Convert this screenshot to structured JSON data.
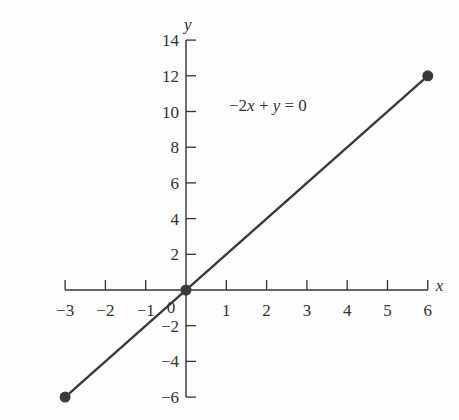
{
  "chart_data": {
    "type": "line",
    "title": "",
    "xlabel": "x",
    "ylabel": "y",
    "annotation": "−2x + y = 0",
    "xlim": [
      -3,
      6
    ],
    "ylim": [
      -6,
      14
    ],
    "grid": false,
    "x_ticks": [
      -3,
      -2,
      -1,
      0,
      1,
      2,
      3,
      4,
      5,
      6
    ],
    "x_tick_labels": [
      "−3",
      "−2",
      "−1",
      "0",
      "1",
      "2",
      "3",
      "4",
      "5",
      "6"
    ],
    "y_ticks": [
      -6,
      -4,
      -2,
      2,
      4,
      6,
      8,
      10,
      12,
      14
    ],
    "y_tick_labels": [
      "−6",
      "−4",
      "−2",
      "2",
      "4",
      "6",
      "8",
      "10",
      "12",
      "14"
    ],
    "series": [
      {
        "name": "−2x + y = 0",
        "x": [
          -3,
          6
        ],
        "y": [
          -6,
          12
        ]
      }
    ],
    "points": [
      {
        "x": -3,
        "y": -6
      },
      {
        "x": 0,
        "y": 0
      },
      {
        "x": 6,
        "y": 12
      }
    ]
  },
  "colors": {
    "line": "#3a3a3a",
    "axis": "#333333",
    "point": "#3a3a3a"
  }
}
